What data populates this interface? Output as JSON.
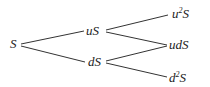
{
  "diagram": {
    "type": "binomial-tree",
    "line_color": "#333333",
    "text_color": "#222222",
    "nodes": {
      "root": {
        "label": "S",
        "x": 10,
        "y": 37
      },
      "up": {
        "label": "uS",
        "x": 86,
        "y": 24
      },
      "down": {
        "label": "dS",
        "x": 88,
        "y": 55
      },
      "upup": {
        "label_base": "u",
        "label_sup": "2",
        "label_tail": "S",
        "x": 172,
        "y": 7
      },
      "updown": {
        "label": "udS",
        "x": 169,
        "y": 38
      },
      "downdown": {
        "label_base": "d",
        "label_sup": "2",
        "label_tail": "S",
        "x": 169,
        "y": 71
      }
    },
    "edges": [
      {
        "from": "root",
        "to": "up",
        "x1": 21,
        "y1": 44,
        "x2": 84,
        "y2": 31
      },
      {
        "from": "root",
        "to": "down",
        "x1": 21,
        "y1": 46,
        "x2": 85,
        "y2": 62
      },
      {
        "from": "up",
        "to": "upup",
        "x1": 106,
        "y1": 30,
        "x2": 168,
        "y2": 15
      },
      {
        "from": "up",
        "to": "updown",
        "x1": 106,
        "y1": 32,
        "x2": 167,
        "y2": 45
      },
      {
        "from": "down",
        "to": "updown",
        "x1": 106,
        "y1": 61,
        "x2": 167,
        "y2": 46
      },
      {
        "from": "down",
        "to": "downdown",
        "x1": 106,
        "y1": 63,
        "x2": 167,
        "y2": 77
      }
    ]
  }
}
